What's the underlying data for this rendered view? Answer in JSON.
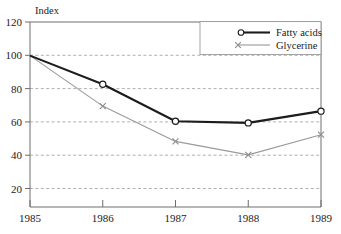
{
  "chart_data": {
    "type": "line",
    "title": "",
    "subtitle": "",
    "xlabel": "",
    "ylabel": "Index",
    "x": [
      "1985",
      "1986",
      "1987",
      "1988",
      "1989"
    ],
    "categories": [
      "1985",
      "1986",
      "1987",
      "1988",
      "1989"
    ],
    "series": [
      {
        "name": "Fatty acids",
        "values": [
          100,
          83,
          61,
          60,
          67
        ],
        "color": "#1c1c1c",
        "marker": "circle",
        "line_width": 2.1
      },
      {
        "name": "Glycerine",
        "values": [
          100,
          70,
          49,
          41,
          53
        ],
        "color": "#9a9a9a",
        "marker": "cross",
        "line_width": 1.1
      }
    ],
    "ylim": [
      10,
      120
    ],
    "yticks": [
      20,
      40,
      60,
      80,
      100,
      120
    ],
    "ytick_labels": [
      "20",
      "40",
      "60",
      "80",
      "100",
      "120"
    ],
    "xtick_labels": [
      "1985",
      "1986",
      "1987",
      "1988",
      "1989"
    ],
    "grid": true,
    "grid_axis": "y",
    "grid_style": "dashed",
    "grid_color": "#9c9c9c",
    "legend_position": "top-right",
    "frame": true,
    "frame_color": "#6e6e6e",
    "background": "#ffffff"
  },
  "legend": {
    "entries": [
      {
        "label": "Fatty acids",
        "marker": "circle-marker",
        "series_index": 0
      },
      {
        "label": "Glycerine",
        "marker": "cross-marker",
        "series_index": 1
      }
    ]
  },
  "labels": {
    "y_axis_unit": "Index",
    "y_ticks": [
      "120",
      "100",
      "80",
      "60",
      "40",
      "20"
    ],
    "x_ticks": [
      "1985",
      "1986",
      "1987",
      "1988",
      "1989"
    ],
    "legend_fatty_acids": "Fatty acids",
    "legend_glycerine": "Glycerine"
  }
}
